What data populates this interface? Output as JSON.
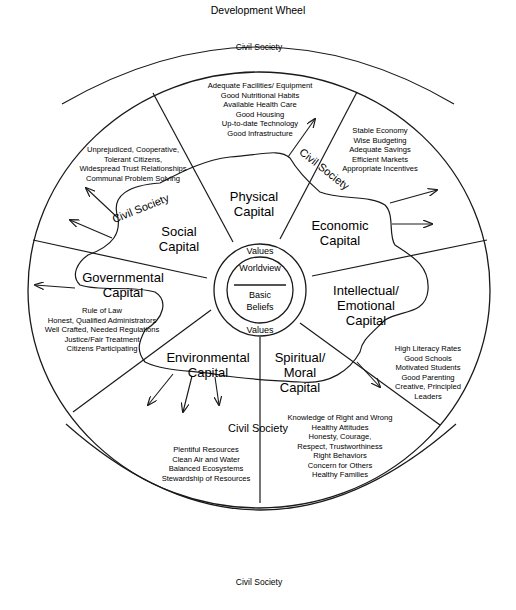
{
  "title": "Development Wheel",
  "outer_labels": {
    "top": "Civil Society",
    "bottom": "Civil Society"
  },
  "hub": {
    "top": "Values",
    "inner_top": "Worldview",
    "inner_bottom_1": "Basic",
    "inner_bottom_2": "Beliefs",
    "bottom": "Values"
  },
  "sectors": [
    {
      "name": "Physical Capital",
      "lines": [
        "Physical",
        "Capital"
      ],
      "attributes": [
        "Adequate Facilities/ Equipment",
        "Good Nutritional Habits",
        "Available Health Care",
        "Good Housing",
        "Up-to-date Technology",
        "Good Infrastructure"
      ]
    },
    {
      "name": "Economic Capital",
      "lines": [
        "Economic",
        "Capital"
      ],
      "attributes": [
        "Stable Economy",
        "Wise Budgeting",
        "Adequate Savings",
        "Efficient Markets",
        "Appropriate Incentives"
      ]
    },
    {
      "name": "Intellectual/Emotional Capital",
      "lines": [
        "Intellectual/",
        "Emotional",
        "Capital"
      ],
      "attributes": [
        "High Literacy Rates",
        "Good Schools",
        "Motivated Students",
        "Good Parenting",
        "Creative, Principled",
        "Leaders"
      ]
    },
    {
      "name": "Spiritual/Moral Capital",
      "lines": [
        "Spiritual/",
        "Moral",
        "Capital"
      ],
      "attributes": [
        "Knowledge of Right and Wrong",
        "Healthy Attitudes",
        "Honesty, Courage,",
        "Respect, Trustworthiness",
        "Right Behaviors",
        "Concern for Others",
        "Healthy Families"
      ]
    },
    {
      "name": "Environmental Capital",
      "lines": [
        "Environmental",
        "Capital"
      ],
      "attributes": [
        "Plentiful Resources",
        "Clean Air and Water",
        "Balanced Ecosystems",
        "Stewardship of Resources"
      ]
    },
    {
      "name": "Governmental Capital",
      "lines": [
        "Governmental",
        "Capital"
      ],
      "attributes": [
        "Rule of Law",
        "Honest, Qualified Administrators",
        "Well Crafted, Needed Regulations",
        "Justice/Fair Treatment",
        "Citizens Participating"
      ]
    },
    {
      "name": "Social Capital",
      "lines": [
        "Social",
        "Capital"
      ],
      "attributes": [
        "Unprejudiced, Cooperative,",
        "Tolerant Citizens,",
        "Widespread Trust Relationships",
        "Communal Problem Solving"
      ]
    }
  ],
  "civil_society_inner_labels": [
    "Civil Society",
    "Civil Society",
    "Civil Society"
  ]
}
